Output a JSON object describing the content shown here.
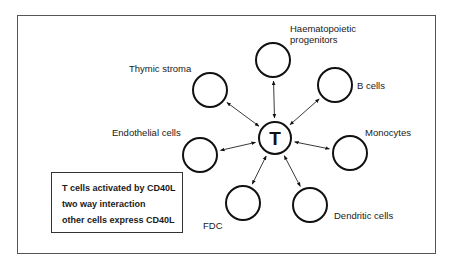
{
  "center": {
    "label": "T"
  },
  "nodes": [
    {
      "id": "haematopoietic",
      "label_lines": [
        "Haematopoietic",
        "progenitors"
      ]
    },
    {
      "id": "bcells",
      "label_lines": [
        "B cells"
      ]
    },
    {
      "id": "monocytes",
      "label_lines": [
        "Monocytes"
      ]
    },
    {
      "id": "dendritic",
      "label_lines": [
        "Dendritic cells"
      ]
    },
    {
      "id": "fdc",
      "label_lines": [
        "FDC"
      ]
    },
    {
      "id": "endothelial",
      "label_lines": [
        "Endothelial cells"
      ]
    },
    {
      "id": "thymic",
      "label_lines": [
        "Thymic stroma"
      ]
    }
  ],
  "edges": [
    {
      "from": "T",
      "to": "haematopoietic",
      "direction": "bidirectional"
    },
    {
      "from": "T",
      "to": "bcells",
      "direction": "bidirectional"
    },
    {
      "from": "T",
      "to": "monocytes",
      "direction": "bidirectional"
    },
    {
      "from": "T",
      "to": "dendritic",
      "direction": "bidirectional"
    },
    {
      "from": "T",
      "to": "fdc",
      "direction": "bidirectional"
    },
    {
      "from": "T",
      "to": "endothelial",
      "direction": "bidirectional"
    },
    {
      "from": "T",
      "to": "thymic",
      "direction": "bidirectional"
    }
  ],
  "legend": {
    "lines": [
      "T cells activated by CD40L",
      "two way interaction",
      "other cells express CD40L"
    ]
  }
}
